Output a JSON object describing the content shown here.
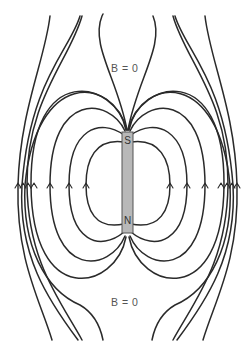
{
  "diagram": {
    "type": "magnetic-field-lines-of-bar-magnet",
    "magnet": {
      "top_pole": "S",
      "bottom_pole": "N",
      "fill_color": "#b8b8b8",
      "border_color": "#555555"
    },
    "labels": {
      "top_null_point": "B = 0",
      "bottom_null_point": "B = 0"
    },
    "arrow_direction": "up",
    "line_color": "#2a2a2a"
  }
}
